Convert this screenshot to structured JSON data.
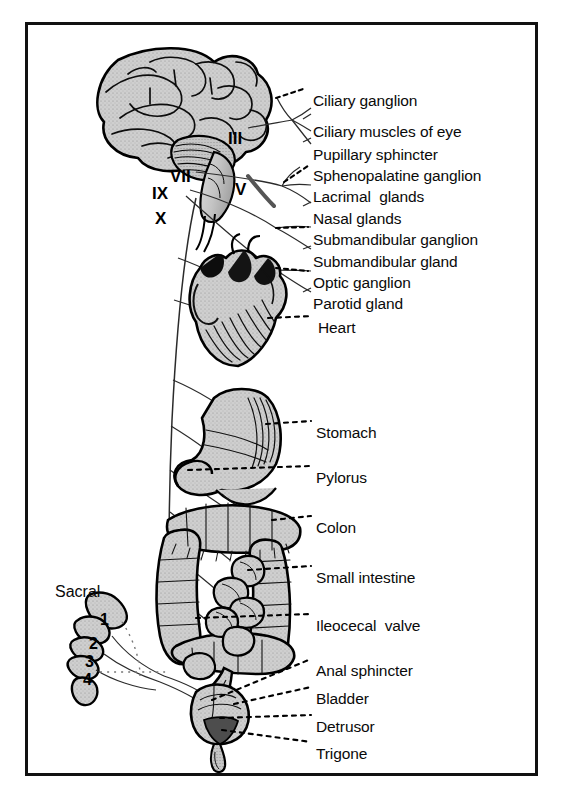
{
  "figure": {
    "border_color": "#111111",
    "organ_fill": "#c9c9c9",
    "ink_color": "#000000"
  },
  "cranial_nerves": [
    {
      "id": "nerve-iii",
      "numeral": "III",
      "x": 228,
      "y": 130
    },
    {
      "id": "nerve-vii",
      "numeral": "VII",
      "x": 170,
      "y": 168
    },
    {
      "id": "nerve-ix",
      "numeral": "IX",
      "x": 152,
      "y": 185
    },
    {
      "id": "nerve-x",
      "numeral": "X",
      "x": 155,
      "y": 210
    },
    {
      "id": "nerve-v",
      "numeral": "V",
      "x": 235,
      "y": 181
    }
  ],
  "sacral": {
    "title": "Sacral",
    "title_x": 55,
    "title_y": 584,
    "vertebrae": [
      {
        "number": "1",
        "x": 100,
        "y": 612
      },
      {
        "number": "2",
        "x": 89,
        "y": 636
      },
      {
        "number": "3",
        "x": 85,
        "y": 654
      },
      {
        "number": "4",
        "x": 83,
        "y": 672
      }
    ]
  },
  "labels": [
    {
      "id": "label-ciliary-ganglion",
      "text": "Ciliary ganglion",
      "x": 313,
      "y": 93
    },
    {
      "id": "label-ciliary-muscles-of-eye",
      "text": "Ciliary muscles of eye",
      "x": 313,
      "y": 124
    },
    {
      "id": "label-pupillary-sphincter",
      "text": "Pupillary sphincter",
      "x": 313,
      "y": 147
    },
    {
      "id": "label-sphenopalatine-ganglion",
      "text": "Sphenopalatine ganglion",
      "x": 313,
      "y": 168
    },
    {
      "id": "label-lacrimal-glands",
      "text": "Lacrimal  glands",
      "x": 313,
      "y": 189
    },
    {
      "id": "label-nasal-glands",
      "text": "Nasal glands",
      "x": 313,
      "y": 211
    },
    {
      "id": "label-submandibular-ganglion",
      "text": "Submandibular ganglion",
      "x": 313,
      "y": 232
    },
    {
      "id": "label-submandibular-gland",
      "text": "Submandibular gland",
      "x": 313,
      "y": 254
    },
    {
      "id": "label-optic-ganglion",
      "text": "Optic ganglion",
      "x": 313,
      "y": 275
    },
    {
      "id": "label-parotid-gland",
      "text": "Parotid gland",
      "x": 313,
      "y": 296
    },
    {
      "id": "label-heart",
      "text": "Heart",
      "x": 318,
      "y": 320
    },
    {
      "id": "label-stomach",
      "text": "Stomach",
      "x": 316,
      "y": 425
    },
    {
      "id": "label-pylorus",
      "text": "Pylorus",
      "x": 316,
      "y": 470
    },
    {
      "id": "label-colon",
      "text": "Colon",
      "x": 316,
      "y": 520
    },
    {
      "id": "label-small-intestine",
      "text": "Small intestine",
      "x": 316,
      "y": 570
    },
    {
      "id": "label-ileocecal-valve",
      "text": "Ileocecal  valve",
      "x": 316,
      "y": 618
    },
    {
      "id": "label-anal-sphincter",
      "text": "Anal sphincter",
      "x": 316,
      "y": 663
    },
    {
      "id": "label-bladder",
      "text": "Bladder",
      "x": 316,
      "y": 691
    },
    {
      "id": "label-detrusor",
      "text": "Detrusor",
      "x": 316,
      "y": 719
    },
    {
      "id": "label-trigone",
      "text": "Trigone",
      "x": 316,
      "y": 746
    }
  ],
  "organs": [
    {
      "id": "brain",
      "name": "brain"
    },
    {
      "id": "heart",
      "name": "heart"
    },
    {
      "id": "stomach",
      "name": "stomach"
    },
    {
      "id": "colon",
      "name": "colon"
    },
    {
      "id": "small-intestine",
      "name": "small-intestine"
    },
    {
      "id": "bladder",
      "name": "bladder"
    },
    {
      "id": "sacrum",
      "name": "sacrum"
    }
  ]
}
